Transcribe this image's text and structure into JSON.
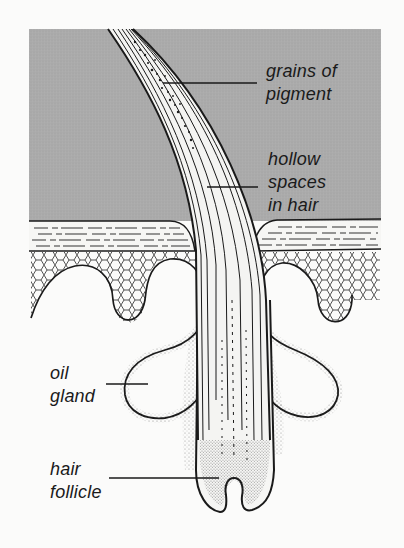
{
  "colors": {
    "background": "#fbfbfa",
    "air": "#aaaaaa",
    "ink": "#1a1a1a",
    "hair_fill": "#f4f4f2"
  },
  "regions": {
    "air": "grey area above skin",
    "epidermis": "layered skin surface",
    "dermis_cells": "cellular layer with lobes",
    "oil_glands": "two sebaceous lobes",
    "hair_shaft": "curved hair with internal strands",
    "follicle": "bulb at hair root"
  },
  "labels": {
    "pigment": {
      "line1": "grains of",
      "line2": "pigment"
    },
    "hollow": {
      "line1": "hollow",
      "line2": "spaces",
      "line3": "in hair"
    },
    "oil_gland": {
      "line1": "oil",
      "line2": "gland"
    },
    "follicle": {
      "line1": "hair",
      "line2": "follicle"
    }
  }
}
